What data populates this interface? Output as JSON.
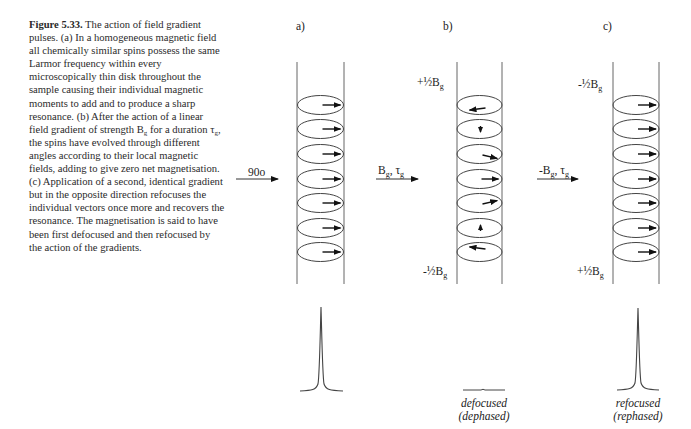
{
  "caption": {
    "figure_label": "Figure 5.33.",
    "text_part1": " The action of field gradient pulses. (a) In a homogeneous magnetic field all chemically similar spins possess the same Larmor frequency within every microscopically thin disk throughout the sample causing their individual magnetic moments to add and to produce a sharp resonance. (b) After the action of a linear field gradient of strength B",
    "sub1": "g",
    "text_part2": " for a duration τ",
    "sub2": "g",
    "text_part3": ", the spins have evolved through different angles according to their local magnetic fields, adding to give zero net magnetisation. (c) Application of a second, identical gradient but in the opposite direction refocuses the individual vectors once more and recovers the resonance. The magnetisation is said to have been first defocused and then refocused by the action of the gradients."
  },
  "panels": [
    {
      "label": "a)",
      "pulse_label": "90o",
      "top_label": "",
      "bottom_label": "",
      "spin_angles_deg": [
        0,
        0,
        0,
        0,
        0,
        0,
        0
      ],
      "spectrum": "sharp-peak",
      "spectrum_caption": [
        "",
        ""
      ]
    },
    {
      "label": "b)",
      "pulse_label_main": "B",
      "pulse_label_sub": "g",
      "pulse_label_tau": ", τ",
      "pulse_label_tau_sub": "g",
      "top_label_main": "+½B",
      "top_label_sub": "g",
      "bottom_label_main": "-½B",
      "bottom_label_sub": "g",
      "spin_angles_deg": [
        200,
        90,
        30,
        0,
        -30,
        -90,
        -200
      ],
      "spectrum": "flat",
      "spectrum_caption": [
        "defocused",
        "(dephased)"
      ]
    },
    {
      "label": "c)",
      "pulse_label_main": "-B",
      "pulse_label_sub": "g",
      "pulse_label_tau": ", τ",
      "pulse_label_tau_sub": "g",
      "top_label_main": "-½B",
      "top_label_sub": "g",
      "bottom_label_main": "+½B",
      "bottom_label_sub": "g",
      "spin_angles_deg": [
        0,
        0,
        0,
        0,
        0,
        0,
        0
      ],
      "spectrum": "sharp-peak",
      "spectrum_caption": [
        "refocused",
        "(rephased)"
      ]
    }
  ],
  "colors": {
    "line": "#555555",
    "arrow": "#111111",
    "text": "#222222"
  }
}
